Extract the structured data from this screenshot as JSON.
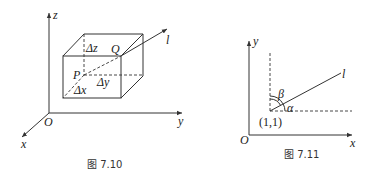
{
  "figures": [
    {
      "caption": "图 7.10",
      "axes": {
        "x": "x",
        "y": "y",
        "z": "z",
        "origin": "O"
      },
      "points": {
        "P": "P",
        "Q": "Q"
      },
      "line": "l",
      "increments": {
        "dx": "Δx",
        "dy": "Δy",
        "dz": "Δz"
      }
    },
    {
      "caption": "图 7.11",
      "axes": {
        "x": "x",
        "y": "y",
        "origin": "O"
      },
      "point": "(1,1)",
      "line": "l",
      "angles": {
        "alpha": "α",
        "beta": "β"
      }
    }
  ]
}
